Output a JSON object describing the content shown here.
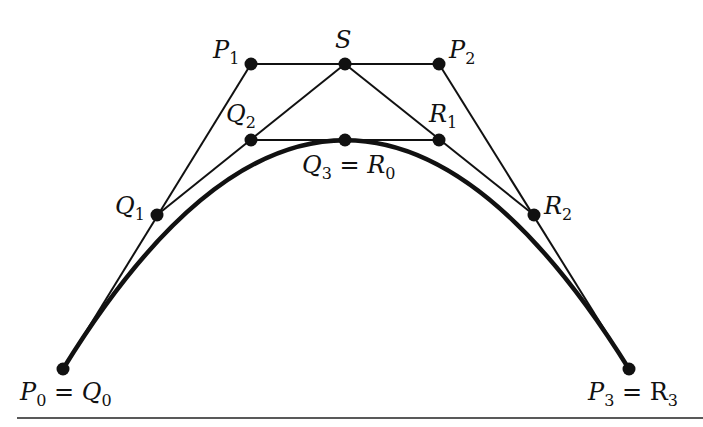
{
  "diagram": {
    "type": "de Casteljau subdivision of a cubic Bezier curve",
    "colors": {
      "ink": "#111111",
      "background": "#ffffff"
    },
    "points": [
      {
        "id": "P0",
        "x": 63,
        "y": 369,
        "label_main": "P",
        "label_sub": "0",
        "label_eq": " = ",
        "label_main2": "Q",
        "label_sub2": "0"
      },
      {
        "id": "P1",
        "x": 251,
        "y": 64,
        "label_main": "P",
        "label_sub": "1"
      },
      {
        "id": "S",
        "x": 345,
        "y": 64,
        "label_main": "S",
        "label_sub": ""
      },
      {
        "id": "P2",
        "x": 439,
        "y": 64,
        "label_main": "P",
        "label_sub": "2"
      },
      {
        "id": "Q1",
        "x": 157,
        "y": 215,
        "label_main": "Q",
        "label_sub": "1"
      },
      {
        "id": "Q2",
        "x": 251,
        "y": 140,
        "label_main": "Q",
        "label_sub": "2"
      },
      {
        "id": "Q3",
        "x": 345,
        "y": 140,
        "label_main": "Q",
        "label_sub": "3",
        "label_eq": " = ",
        "label_main2": "R",
        "label_sub2": "0"
      },
      {
        "id": "R1",
        "x": 439,
        "y": 140,
        "label_main": "R",
        "label_sub": "1"
      },
      {
        "id": "R2",
        "x": 534,
        "y": 215,
        "label_main": "R",
        "label_sub": "2"
      },
      {
        "id": "P3",
        "x": 629,
        "y": 369,
        "label_main": "P",
        "label_sub": "3",
        "label_eq": " = ",
        "label_main2": "R",
        "label_sub2": "3"
      }
    ],
    "segments": [
      [
        "P0",
        "P1"
      ],
      [
        "P1",
        "S"
      ],
      [
        "S",
        "P2"
      ],
      [
        "P2",
        "P3"
      ],
      [
        "Q1",
        "Q2"
      ],
      [
        "Q2",
        "S"
      ],
      [
        "S",
        "R1"
      ],
      [
        "R1",
        "R2"
      ],
      [
        "Q2",
        "Q3"
      ],
      [
        "Q3",
        "R1"
      ]
    ],
    "curve": {
      "from": "P0",
      "ctrl1": "P1",
      "ctrl2": "P2",
      "to": "P3"
    }
  }
}
